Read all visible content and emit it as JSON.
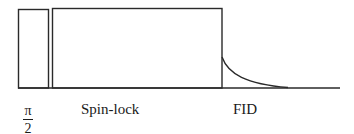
{
  "diagram": {
    "title": "",
    "type": "pulse-sequence",
    "stroke_color": "#2a2a2a",
    "background": "#ffffff",
    "baseline": {
      "x1": 18,
      "x2": 340,
      "y": 88
    },
    "pulses": [
      {
        "id": "pi-over-2",
        "label_numerator": "π",
        "label_denominator": "2",
        "x": 18,
        "y": 9,
        "width": 30,
        "height": 79
      },
      {
        "id": "spin-lock",
        "label": "Spin-lock",
        "x": 52,
        "y": 8,
        "width": 170,
        "height": 80
      }
    ],
    "signal": {
      "id": "fid",
      "label": "FID",
      "start": {
        "x": 222,
        "y": 57
      },
      "end": {
        "x": 288,
        "y": 87
      }
    }
  }
}
